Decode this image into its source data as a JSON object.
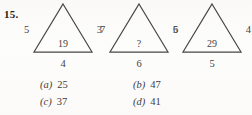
{
  "question": {
    "number": "15.",
    "type": "multiple-choice-figure-puzzle"
  },
  "figures": [
    {
      "name": "triangle-1",
      "left_label": "5",
      "right_label": "3",
      "center_label": "19",
      "base_label": "4"
    },
    {
      "name": "triangle-2",
      "left_label": "7",
      "right_label": "5",
      "center_label": "?",
      "base_label": "6"
    },
    {
      "name": "triangle-3",
      "left_label": "6",
      "right_label": "4",
      "center_label": "29",
      "base_label": "5"
    }
  ],
  "options": [
    {
      "label": "(a)",
      "value": "25"
    },
    {
      "label": "(b)",
      "value": "47"
    },
    {
      "label": "(c)",
      "value": "37"
    },
    {
      "label": "(d)",
      "value": "41"
    }
  ],
  "colors": {
    "ink": "#3c3a38",
    "stroke": "#4a4745",
    "paper": "#fdfdfc"
  }
}
